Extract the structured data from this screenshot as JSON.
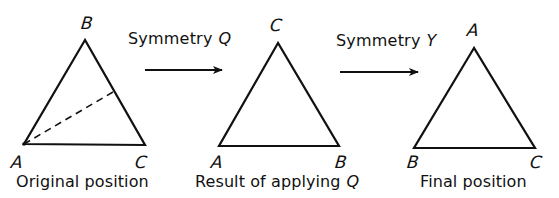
{
  "diagram": {
    "colors": {
      "ink": "#111111",
      "background": "#ffffff"
    },
    "panels": [
      {
        "id": "original",
        "caption": "Original position",
        "vertices": {
          "top": "B",
          "bottom_left": "A",
          "bottom_right": "C"
        },
        "has_dashed_axis": true,
        "dashed_axis_note": "reflection axis from vertex A to midpoint of side BC"
      },
      {
        "id": "after_q",
        "caption": "Result of applying",
        "caption_symbol": "Q",
        "vertices": {
          "top": "C",
          "bottom_left": "A",
          "bottom_right": "B"
        },
        "has_dashed_axis": false
      },
      {
        "id": "final",
        "caption": "Final position",
        "vertices": {
          "top": "A",
          "bottom_left": "B",
          "bottom_right": "C"
        },
        "has_dashed_axis": false
      }
    ],
    "transitions": [
      {
        "label": "Symmetry",
        "symbol": "Q",
        "arrow": "right-arrow"
      },
      {
        "label": "Symmetry",
        "symbol": "Y",
        "arrow": "right-arrow"
      }
    ]
  }
}
